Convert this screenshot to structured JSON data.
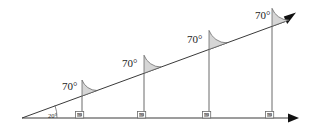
{
  "diagram": {
    "vertex_angle_label": "20°",
    "corresponding_angle_labels": [
      "70°",
      "70°",
      "70°",
      "70°"
    ],
    "right_angle_labels": [
      "90",
      "90",
      "90",
      "90"
    ],
    "colors": {
      "background": "#ffffff",
      "ray_stroke": "#3a3a3a",
      "vertical_stroke": "#6b6b6b",
      "sector_fill": "#d6d6d6",
      "sector_stroke": "#5a5a5a",
      "arrow_fill": "#111111",
      "right_angle_box_fill": "#ffffff",
      "right_angle_inner_fill": "#b9b9b9",
      "text": "#1c1c1c"
    },
    "geometry": {
      "apex_x": 22,
      "apex_y": 118,
      "baseline_y": 118,
      "baseline_end_x": 292,
      "ray_end_x": 292,
      "ray_end_y": 19,
      "vertical_x_positions": [
        82,
        144,
        209,
        272
      ]
    }
  }
}
